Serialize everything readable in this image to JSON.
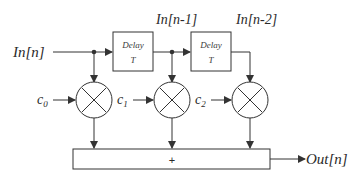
{
  "diagram": {
    "type": "FIR filter block diagram (tapped delay line)",
    "input_label": "In[n]",
    "output_label": "Out[n]",
    "delay_blocks": [
      {
        "line1": "Delay",
        "line2": "T",
        "output_label": "In[n-1]"
      },
      {
        "line1": "Delay",
        "line2": "T",
        "output_label": "In[n-2]"
      }
    ],
    "coefficients": [
      {
        "base": "c",
        "sub": "0"
      },
      {
        "base": "c",
        "sub": "1"
      },
      {
        "base": "c",
        "sub": "2"
      }
    ],
    "multiplier_symbol": "×",
    "summer_symbol": "+",
    "line_color": "#333333"
  }
}
